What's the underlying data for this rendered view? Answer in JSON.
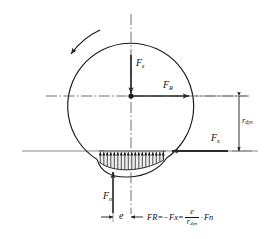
{
  "figure": {
    "type": "technical-diagram"
  },
  "colors": {
    "line": "#1a1a1a",
    "arrow": "#2b2b2b",
    "centerline": "#555555",
    "ground": "#8a8a8a",
    "pressure": "#1a1a1a",
    "background": "#ffffff"
  },
  "labels": {
    "fz": {
      "base": "F",
      "sub": "z"
    },
    "fr": {
      "base": "F",
      "sub": "R"
    },
    "fx": {
      "base": "F",
      "sub": "x"
    },
    "fn": {
      "base": "F",
      "sub": "n"
    },
    "rdyn": {
      "base": "r",
      "sub": "dyn"
    },
    "e": {
      "base": "e",
      "sub": ""
    }
  },
  "formula": {
    "lhs_base": "F",
    "lhs_sub": "R",
    "eq1": "=",
    "minus": "−",
    "mid_base": "F",
    "mid_sub": "x",
    "eq2": "=",
    "num": "e",
    "den_base": "r",
    "den_sub": "dyn",
    "dot": "·",
    "rhs_base": "F",
    "rhs_sub": "n",
    "plain": "F_R = −F_x = (e / r_dyn) · F_n"
  },
  "geometry": {
    "wheel_center_x": 131,
    "wheel_center_y": 96,
    "wheel_radius": 63,
    "ground_y": 151,
    "contact_left_x": 97,
    "contact_right_x": 167,
    "rdyn_value": "r_dyn",
    "offset_value": "e",
    "rotation_direction": "counter-clockwise"
  },
  "elements": {
    "wheel": "wheel-outline",
    "rotation_arrow": "rotation-direction-arrow",
    "horizontal_axis": "horizontal-centerline",
    "vertical_axis": "vertical-centerline",
    "ground": "ground-line",
    "pressure_distribution": "contact-patch-pressure-arrows",
    "rdyn_dimension": "rdyn-dimension-line",
    "e_dimension": "eccentricity-dimension-line"
  }
}
